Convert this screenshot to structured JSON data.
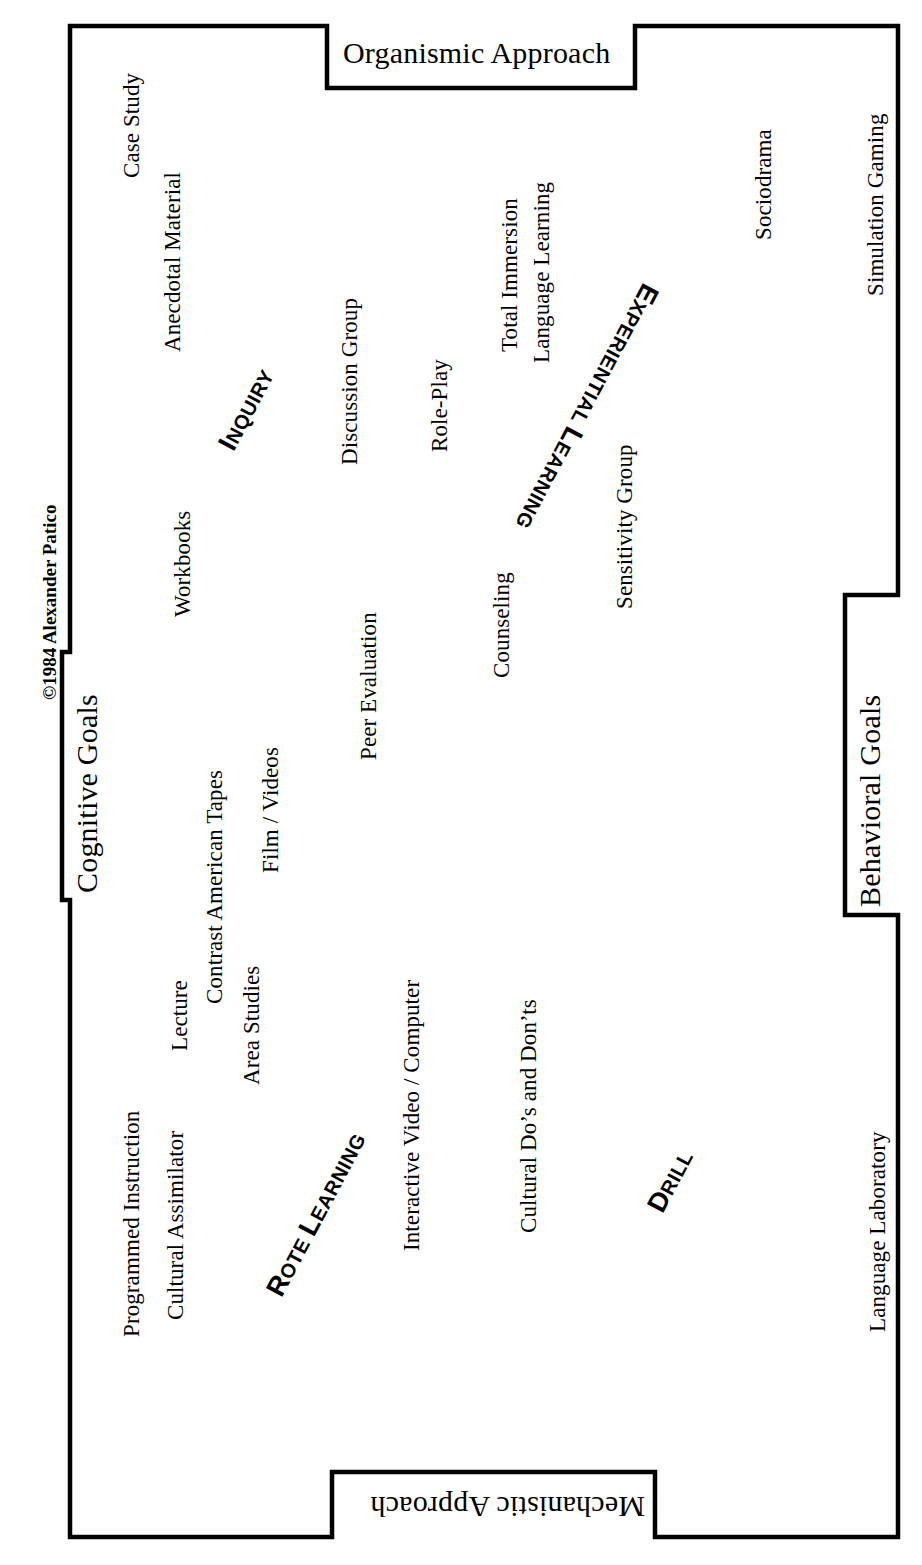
{
  "meta": {
    "copyright": "©1984 Alexander Patico",
    "line_color": "#000000",
    "background": "#ffffff"
  },
  "axes": [
    {
      "id": "organismic",
      "label": "Organismic Approach",
      "position": "top"
    },
    {
      "id": "mechanistic",
      "label": "Mechanistic Approach",
      "position": "bottom"
    },
    {
      "id": "cognitive",
      "label": "Cognitive Goals",
      "position": "left"
    },
    {
      "id": "behavioral",
      "label": "Behavioral Goals",
      "position": "right"
    }
  ],
  "quadrants": [
    {
      "id": "inquiry",
      "label": "Inquiry"
    },
    {
      "id": "experiential",
      "label": "Experiential Learning"
    },
    {
      "id": "rote",
      "label": "Rote Learning"
    },
    {
      "id": "drill",
      "label": "Drill"
    }
  ],
  "items": [
    {
      "id": "case-study",
      "label": "Case Study"
    },
    {
      "id": "anecdotal-material",
      "label": "Anecdotal Material"
    },
    {
      "id": "discussion-group",
      "label": "Discussion Group"
    },
    {
      "id": "role-play",
      "label": "Role-Play"
    },
    {
      "id": "total-immersion",
      "label": "Total Immersion"
    },
    {
      "id": "language-learning",
      "label": "Language Learning"
    },
    {
      "id": "sociodrama",
      "label": "Sociodrama"
    },
    {
      "id": "simulation-gaming",
      "label": "Simulation Gaming"
    },
    {
      "id": "workbooks",
      "label": "Workbooks"
    },
    {
      "id": "sensitivity-group",
      "label": "Sensitivity Group"
    },
    {
      "id": "counseling",
      "label": "Counseling"
    },
    {
      "id": "peer-evaluation",
      "label": "Peer Evaluation"
    },
    {
      "id": "contrast-american-tapes",
      "label": "Contrast American Tapes"
    },
    {
      "id": "film-videos",
      "label": "Film / Videos"
    },
    {
      "id": "lecture",
      "label": "Lecture"
    },
    {
      "id": "area-studies",
      "label": "Area Studies"
    },
    {
      "id": "programmed-instruction",
      "label": "Programmed Instruction"
    },
    {
      "id": "cultural-assimilator",
      "label": "Cultural Assimilator"
    },
    {
      "id": "interactive-video",
      "label": "Interactive Video / Computer"
    },
    {
      "id": "cultural-dos-donts",
      "label": "Cultural Do’s and Don’ts"
    },
    {
      "id": "language-laboratory",
      "label": "Language Laboratory"
    }
  ]
}
